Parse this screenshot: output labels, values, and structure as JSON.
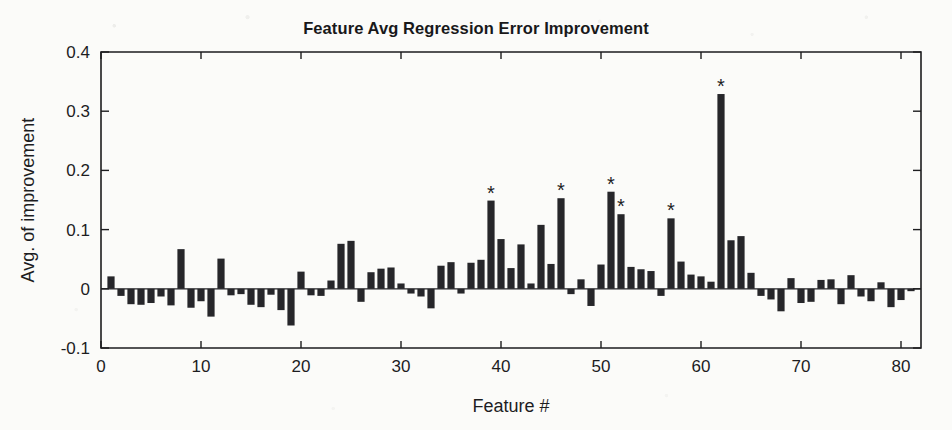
{
  "figure": {
    "width": 952,
    "height": 430,
    "background_color": "#fbfbf9",
    "bar_color": "#26262a",
    "axis_color": "#1d1d1f"
  },
  "chart_data": {
    "type": "bar",
    "title": "Feature Avg Regression Error Improvement",
    "xlabel": "Feature #",
    "ylabel": "Avg. of improvement",
    "xlim": [
      0,
      82
    ],
    "ylim": [
      -0.1,
      0.4
    ],
    "xticks": [
      0,
      10,
      20,
      30,
      40,
      50,
      60,
      70,
      80
    ],
    "xtick_labels": [
      "0",
      "10",
      "20",
      "30",
      "40",
      "50",
      "60",
      "70",
      "80"
    ],
    "yticks": [
      -0.1,
      0,
      0.1,
      0.2,
      0.3,
      0.4
    ],
    "ytick_labels": [
      "-0.1",
      "0",
      "0.1",
      "0.2",
      "0.3",
      "0.4"
    ],
    "grid": false,
    "legend": false,
    "zero_reference_line": true,
    "categories": [
      1,
      2,
      3,
      4,
      5,
      6,
      7,
      8,
      9,
      10,
      11,
      12,
      13,
      14,
      15,
      16,
      17,
      18,
      19,
      20,
      21,
      22,
      23,
      24,
      25,
      26,
      27,
      28,
      29,
      30,
      31,
      32,
      33,
      34,
      35,
      36,
      37,
      38,
      39,
      40,
      41,
      42,
      43,
      44,
      45,
      46,
      47,
      48,
      49,
      50,
      51,
      52,
      53,
      54,
      55,
      56,
      57,
      58,
      59,
      60,
      61,
      62,
      63,
      64,
      65,
      66,
      67,
      68,
      69,
      70,
      71,
      72,
      73,
      74,
      75,
      76,
      77,
      78,
      79,
      80,
      81
    ],
    "values": [
      0.021,
      -0.012,
      -0.026,
      -0.027,
      -0.024,
      -0.013,
      -0.028,
      0.067,
      -0.032,
      -0.021,
      -0.047,
      0.051,
      -0.011,
      -0.009,
      -0.027,
      -0.031,
      -0.01,
      -0.036,
      -0.062,
      0.029,
      -0.011,
      -0.012,
      0.014,
      0.076,
      0.081,
      -0.022,
      0.028,
      0.034,
      0.036,
      0.009,
      -0.008,
      -0.013,
      -0.033,
      0.039,
      0.045,
      -0.008,
      0.044,
      0.049,
      0.149,
      0.084,
      0.035,
      0.075,
      0.009,
      0.108,
      0.042,
      0.153,
      -0.009,
      0.016,
      -0.029,
      0.041,
      0.164,
      0.126,
      0.037,
      0.033,
      0.03,
      -0.012,
      0.119,
      0.046,
      0.024,
      0.021,
      0.012,
      0.329,
      0.082,
      0.089,
      0.027,
      -0.012,
      -0.018,
      -0.038,
      0.018,
      -0.024,
      -0.022,
      0.015,
      0.016,
      -0.026,
      0.023,
      -0.013,
      -0.021,
      0.011,
      -0.031,
      -0.019,
      -0.004
    ],
    "significance_markers": {
      "symbol": "*",
      "features": [
        39,
        46,
        51,
        52,
        57,
        62
      ]
    }
  }
}
